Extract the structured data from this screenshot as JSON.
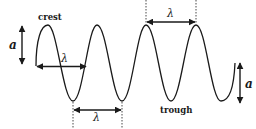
{
  "diagram": {
    "colors": {
      "stroke": "#1a1a1a",
      "background": "#ffffff"
    },
    "labels": {
      "crest": "crest",
      "trough": "trough",
      "amplitude_left": "a",
      "amplitude_right": "a",
      "wavelength_left": "λ",
      "wavelength_bottom": "λ",
      "wavelength_top": "λ"
    },
    "annotations": [
      {
        "type": "amplitude-arrow",
        "label": "a",
        "position": "left"
      },
      {
        "type": "wavelength-arrow",
        "label": "λ",
        "position": "midline, first wave"
      },
      {
        "type": "wavelength-arrow",
        "label": "λ",
        "position": "between troughs, bottom"
      },
      {
        "type": "wavelength-arrow",
        "label": "λ",
        "position": "between crests, top"
      },
      {
        "type": "amplitude-arrow",
        "label": "a",
        "position": "right"
      }
    ]
  }
}
